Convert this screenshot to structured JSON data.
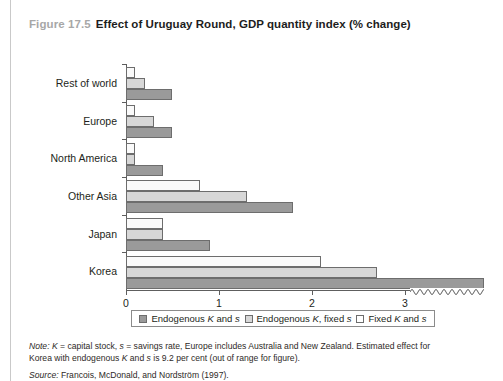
{
  "figure": {
    "number": "Figure 17.5",
    "title": "Effect of Uruguay Round, GDP quantity index (% change)"
  },
  "chart_data": {
    "type": "bar",
    "orientation": "horizontal",
    "title": "Effect of Uruguay Round, GDP quantity index (% change)",
    "xlabel": "",
    "ylabel": "",
    "xlim": [
      0,
      3.85
    ],
    "xticks": [
      0,
      1,
      2,
      3
    ],
    "xticklabels": [
      "0",
      "1",
      "2",
      "3"
    ],
    "grid": false,
    "axis_break": {
      "present": true,
      "after_value": 3.05,
      "note": "wavy break on x-axis; Korea endogenous K and s bar runs off scale"
    },
    "legend_position": "bottom",
    "categories": [
      "Rest of world",
      "Europe",
      "North America",
      "Other Asia",
      "Japan",
      "Korea"
    ],
    "series": [
      {
        "name": "Endogenous K and s",
        "color": "#9a9a9a",
        "values": [
          0.5,
          0.5,
          0.4,
          1.8,
          0.9,
          9.2
        ],
        "display_values": [
          0.5,
          0.5,
          0.4,
          1.8,
          0.9,
          3.85
        ]
      },
      {
        "name": "Endogenous K, fixed s",
        "color": "#d7d7d7",
        "values": [
          0.2,
          0.3,
          0.1,
          1.3,
          0.4,
          2.7
        ],
        "display_values": [
          0.2,
          0.3,
          0.1,
          1.3,
          0.4,
          2.7
        ]
      },
      {
        "name": "Fixed K and s",
        "color": "#fafafa",
        "values": [
          0.1,
          0.1,
          0.1,
          0.8,
          0.4,
          2.1
        ],
        "display_values": [
          0.1,
          0.1,
          0.1,
          0.8,
          0.4,
          2.1
        ]
      }
    ]
  },
  "legend": {
    "items": [
      {
        "label": "Endogenous K and s",
        "swatch": "dark"
      },
      {
        "label": "Endogenous K, fixed s",
        "swatch": "light"
      },
      {
        "label": "Fixed K and s",
        "swatch": "white"
      }
    ]
  },
  "notes": {
    "note_label": "Note:",
    "note_text": " K = capital stock, s = savings rate, Europe includes Australia and New Zealand. Estimated effect for Korea with endogenous K and s is 9.2 per cent (out of range for figure).",
    "source_label": "Source:",
    "source_text": " Francois, McDonald, and Nordström (1997)."
  }
}
